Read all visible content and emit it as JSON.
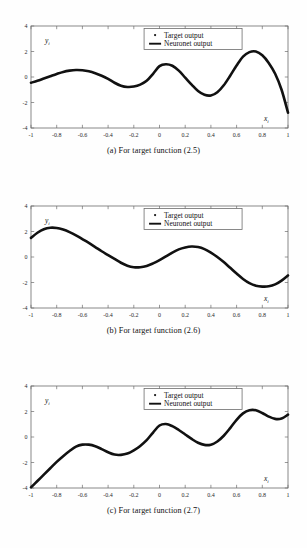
{
  "figures": [
    {
      "id": "a",
      "caption": "(a) For target function (2.5)",
      "chart_data": {
        "type": "line",
        "title": "",
        "xlabel": "x_i",
        "ylabel": "y_i",
        "xlim": [
          -1,
          1
        ],
        "ylim": [
          -4,
          4
        ],
        "xticks": [
          "-1",
          "-0.8",
          "-0.6",
          "-0.4",
          "-0.2",
          "0",
          "0.2",
          "0.4",
          "0.6",
          "0.8",
          "1"
        ],
        "xtick_values": [
          -1,
          -0.8,
          -0.6,
          -0.4,
          -0.2,
          0,
          0.2,
          0.4,
          0.6,
          0.8,
          1
        ],
        "yticks": [
          "4",
          "2",
          "0",
          "-2",
          "-4"
        ],
        "ytick_values": [
          4,
          2,
          0,
          -2,
          -4
        ],
        "grid": false,
        "legend_position": "top-center-right",
        "legend": [
          {
            "label": "Target output",
            "marker": "dot",
            "color": "#111111"
          },
          {
            "label": "Neuronet output",
            "marker": "line",
            "color": "#111111"
          }
        ],
        "series": [
          {
            "name": "Neuronet output",
            "x": [
              -1,
              -0.95,
              -0.9,
              -0.85,
              -0.8,
              -0.75,
              -0.7,
              -0.65,
              -0.6,
              -0.55,
              -0.5,
              -0.45,
              -0.4,
              -0.35,
              -0.3,
              -0.25,
              -0.2,
              -0.15,
              -0.1,
              -0.05,
              0,
              0.05,
              0.1,
              0.15,
              0.2,
              0.25,
              0.3,
              0.35,
              0.4,
              0.45,
              0.5,
              0.55,
              0.6,
              0.65,
              0.7,
              0.75,
              0.8,
              0.85,
              0.9,
              0.95,
              1
            ],
            "y": [
              -0.45,
              -0.3,
              -0.12,
              0.06,
              0.24,
              0.4,
              0.5,
              0.55,
              0.53,
              0.45,
              0.3,
              0.1,
              -0.15,
              -0.45,
              -0.68,
              -0.78,
              -0.75,
              -0.6,
              -0.3,
              0.25,
              0.85,
              1.0,
              0.88,
              0.5,
              -0.05,
              -0.6,
              -1.1,
              -1.4,
              -1.45,
              -1.2,
              -0.65,
              0.1,
              0.9,
              1.6,
              1.95,
              2.0,
              1.7,
              1.1,
              0.25,
              -1.0,
              -2.8
            ]
          }
        ]
      }
    },
    {
      "id": "b",
      "caption": "(b) For target function (2.6)",
      "chart_data": {
        "type": "line",
        "title": "",
        "xlabel": "x_i",
        "ylabel": "y_i",
        "xlim": [
          -1,
          1
        ],
        "ylim": [
          -4,
          4
        ],
        "xticks": [
          "-1",
          "-0.8",
          "-0.6",
          "-0.4",
          "-0.2",
          "0",
          "0.2",
          "0.4",
          "0.6",
          "0.8",
          "1"
        ],
        "xtick_values": [
          -1,
          -0.8,
          -0.6,
          -0.4,
          -0.2,
          0,
          0.2,
          0.4,
          0.6,
          0.8,
          1
        ],
        "yticks": [
          "4",
          "2",
          "0",
          "-2",
          "-4"
        ],
        "ytick_values": [
          4,
          2,
          0,
          -2,
          -4
        ],
        "grid": false,
        "legend_position": "top-center-right",
        "legend": [
          {
            "label": "Target output",
            "marker": "dot",
            "color": "#111111"
          },
          {
            "label": "Neuronet output",
            "marker": "line",
            "color": "#111111"
          }
        ],
        "series": [
          {
            "name": "Neuronet output",
            "x": [
              -1,
              -0.95,
              -0.9,
              -0.85,
              -0.8,
              -0.75,
              -0.7,
              -0.65,
              -0.6,
              -0.55,
              -0.5,
              -0.45,
              -0.4,
              -0.35,
              -0.3,
              -0.25,
              -0.2,
              -0.15,
              -0.1,
              -0.05,
              0,
              0.05,
              0.1,
              0.15,
              0.2,
              0.25,
              0.3,
              0.35,
              0.4,
              0.45,
              0.5,
              0.55,
              0.6,
              0.65,
              0.7,
              0.75,
              0.8,
              0.85,
              0.9,
              0.95,
              1
            ],
            "y": [
              1.5,
              1.9,
              2.18,
              2.3,
              2.28,
              2.15,
              1.95,
              1.7,
              1.4,
              1.1,
              0.78,
              0.45,
              0.15,
              -0.15,
              -0.45,
              -0.68,
              -0.8,
              -0.8,
              -0.7,
              -0.5,
              -0.25,
              0.05,
              0.35,
              0.6,
              0.75,
              0.82,
              0.78,
              0.62,
              0.35,
              0.0,
              -0.4,
              -0.85,
              -1.3,
              -1.72,
              -2.05,
              -2.25,
              -2.32,
              -2.3,
              -2.15,
              -1.85,
              -1.45
            ]
          }
        ]
      }
    },
    {
      "id": "c",
      "caption": "(c) For target function (2.7)",
      "chart_data": {
        "type": "line",
        "title": "",
        "xlabel": "x_i",
        "ylabel": "y_i",
        "xlim": [
          -1,
          1
        ],
        "ylim": [
          -4,
          4
        ],
        "xticks": [
          "-1",
          "-0.8",
          "-0.6",
          "-0.4",
          "-0.2",
          "0",
          "0.2",
          "0.4",
          "0.6",
          "0.8",
          "1"
        ],
        "xtick_values": [
          -1,
          -0.8,
          -0.6,
          -0.4,
          -0.2,
          0,
          0.2,
          0.4,
          0.6,
          0.8,
          1
        ],
        "yticks": [
          "4",
          "2",
          "0",
          "-2",
          "-4"
        ],
        "ytick_values": [
          4,
          2,
          0,
          -2,
          -4
        ],
        "grid": false,
        "legend_position": "top-center-right",
        "legend": [
          {
            "label": "Target output",
            "marker": "dot",
            "color": "#111111"
          },
          {
            "label": "Neuronet output",
            "marker": "line",
            "color": "#111111"
          }
        ],
        "series": [
          {
            "name": "Neuronet output",
            "x": [
              -1,
              -0.95,
              -0.9,
              -0.85,
              -0.8,
              -0.75,
              -0.7,
              -0.65,
              -0.6,
              -0.55,
              -0.5,
              -0.45,
              -0.4,
              -0.35,
              -0.3,
              -0.25,
              -0.2,
              -0.15,
              -0.1,
              -0.05,
              0,
              0.05,
              0.1,
              0.15,
              0.2,
              0.25,
              0.3,
              0.35,
              0.4,
              0.45,
              0.5,
              0.55,
              0.6,
              0.65,
              0.7,
              0.75,
              0.8,
              0.85,
              0.9,
              0.95,
              1
            ],
            "y": [
              -3.95,
              -3.45,
              -2.95,
              -2.45,
              -1.95,
              -1.5,
              -1.1,
              -0.75,
              -0.6,
              -0.6,
              -0.72,
              -0.95,
              -1.2,
              -1.38,
              -1.4,
              -1.3,
              -1.05,
              -0.7,
              -0.25,
              0.35,
              0.9,
              1.02,
              0.85,
              0.55,
              0.2,
              -0.15,
              -0.45,
              -0.62,
              -0.6,
              -0.35,
              0.1,
              0.7,
              1.35,
              1.85,
              2.1,
              2.1,
              1.88,
              1.6,
              1.42,
              1.45,
              1.75
            ]
          }
        ]
      }
    }
  ]
}
